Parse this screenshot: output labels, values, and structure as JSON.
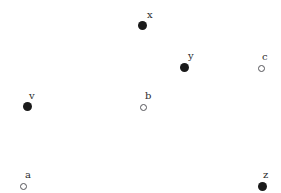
{
  "figure": {
    "type": "point-diagram",
    "width": 281,
    "height": 193,
    "background_color": "#ffffff",
    "filled_marker_color": "#1a1a1a",
    "hollow_marker_color": "#ffffff",
    "hollow_marker_stroke": "#55555a",
    "label_color": "#2b2b2b"
  },
  "chart_data": {
    "type": "scatter",
    "title": "",
    "subtitle": "",
    "xlabel": "",
    "ylabel": "",
    "xlim": [
      0,
      281
    ],
    "ylim": [
      0,
      193
    ],
    "grid": false,
    "axes_visible": false,
    "legend": null,
    "tick_labels": {
      "x": [],
      "y": []
    },
    "series": [
      {
        "name": "filled",
        "marker": "filled-circle",
        "color": "#1a1a1a",
        "points": [
          {
            "label": "x",
            "x": 142,
            "y": 25
          },
          {
            "label": "y",
            "x": 184,
            "y": 67
          },
          {
            "label": "v",
            "x": 27,
            "y": 106
          },
          {
            "label": "z",
            "x": 262,
            "y": 186
          }
        ]
      },
      {
        "name": "hollow",
        "marker": "open-circle",
        "color": "#55555a",
        "points": [
          {
            "label": "c",
            "x": 261,
            "y": 68
          },
          {
            "label": "b",
            "x": 143,
            "y": 107
          },
          {
            "label": "a",
            "x": 23,
            "y": 186
          }
        ]
      }
    ]
  },
  "points": [
    {
      "id": "x",
      "label": "x",
      "x": 142,
      "y": 25,
      "style": "filled",
      "label_dx": 5,
      "label_dy": -15
    },
    {
      "id": "y",
      "label": "y",
      "x": 184,
      "y": 67,
      "style": "filled",
      "label_dx": 4,
      "label_dy": -16
    },
    {
      "id": "c",
      "label": "c",
      "x": 261,
      "y": 68,
      "style": "hollow",
      "label_dx": 1,
      "label_dy": -16
    },
    {
      "id": "v",
      "label": "v",
      "x": 27,
      "y": 106,
      "style": "filled",
      "label_dx": 2,
      "label_dy": -15
    },
    {
      "id": "b",
      "label": "b",
      "x": 143,
      "y": 107,
      "style": "hollow",
      "label_dx": 2,
      "label_dy": -16
    },
    {
      "id": "a",
      "label": "a",
      "x": 23,
      "y": 186,
      "style": "hollow",
      "label_dx": 2,
      "label_dy": -16
    },
    {
      "id": "z",
      "label": "z",
      "x": 262,
      "y": 186,
      "style": "filled",
      "label_dx": 1,
      "label_dy": -16
    }
  ]
}
